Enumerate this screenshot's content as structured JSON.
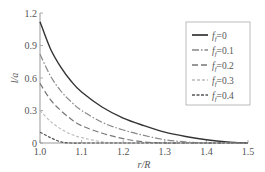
{
  "chart_data": {
    "type": "line",
    "title": "",
    "xlabel": "r/R",
    "ylabel": "l/a",
    "xlim": [
      1.0,
      1.5
    ],
    "ylim": [
      0,
      1.2
    ],
    "x_ticks": [
      "1.0",
      "1.1",
      "1.2",
      "1.3",
      "1.4",
      "1.5"
    ],
    "y_ticks": [
      "0",
      "0.3",
      "0.6",
      "0.9",
      "1.2"
    ],
    "grid": false,
    "legend_position": "upper right",
    "x": [
      1.0,
      1.025,
      1.05,
      1.075,
      1.1,
      1.15,
      1.2,
      1.25,
      1.3,
      1.35,
      1.4,
      1.45,
      1.5
    ],
    "series": [
      {
        "name": "f_f=0",
        "style": "solid",
        "color": "#333333",
        "values": [
          1.12,
          0.87,
          0.7,
          0.57,
          0.47,
          0.33,
          0.23,
          0.16,
          0.1,
          0.06,
          0.03,
          0.01,
          0.0
        ]
      },
      {
        "name": "f_f=0.1",
        "style": "dash-dot",
        "color": "#888888",
        "values": [
          0.82,
          0.62,
          0.48,
          0.38,
          0.3,
          0.19,
          0.12,
          0.07,
          0.03,
          0.01,
          0.0,
          0.0,
          0.0
        ]
      },
      {
        "name": "f_f=0.2",
        "style": "dashed",
        "color": "#777777",
        "values": [
          0.55,
          0.4,
          0.3,
          0.22,
          0.16,
          0.09,
          0.04,
          0.01,
          0.0,
          0.0,
          0.0,
          0.0,
          0.0
        ]
      },
      {
        "name": "f_f=0.3",
        "style": "dotted",
        "color": "#bbbbbb",
        "values": [
          0.3,
          0.2,
          0.13,
          0.08,
          0.05,
          0.01,
          0.0,
          0.0,
          0.0,
          0.0,
          0.0,
          0.0,
          0.0
        ]
      },
      {
        "name": "f_f=0.4",
        "style": "short-dash",
        "color": "#555555",
        "values": [
          0.1,
          0.05,
          0.01,
          0.0,
          0.0,
          0.0,
          0.0,
          0.0,
          0.0,
          0.0,
          0.0,
          0.0,
          0.0
        ]
      }
    ]
  },
  "legend": {
    "items": [
      {
        "sym": "f",
        "sub": "f",
        "val": "=0"
      },
      {
        "sym": "f",
        "sub": "f",
        "val": "=0.1"
      },
      {
        "sym": "f",
        "sub": "f",
        "val": "=0.2"
      },
      {
        "sym": "f",
        "sub": "f",
        "val": "=0.3"
      },
      {
        "sym": "f",
        "sub": "f",
        "val": "=0.4"
      }
    ]
  }
}
